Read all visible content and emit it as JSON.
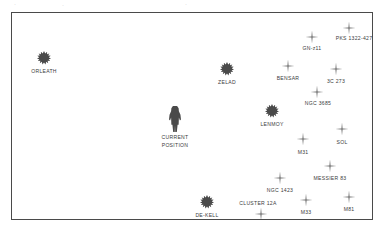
{
  "map": {
    "title": "star-chart",
    "frame_color": "#4a4a4a",
    "background_color": "#ffffff",
    "label_color": "#3c3c3c",
    "top_artifacts": [
      {
        "text": "·",
        "x": 14,
        "y": 1
      },
      {
        "text": "·",
        "x": 62,
        "y": 2
      },
      {
        "text": "·",
        "x": 185,
        "y": 1
      }
    ],
    "markers": [
      {
        "id": "orleath",
        "name": "ORLEATH",
        "type": "blob",
        "x": 43,
        "y": 57,
        "label_x": 43,
        "label_y": 67
      },
      {
        "id": "zelad",
        "name": "ZELAD",
        "type": "blob",
        "x": 226,
        "y": 68,
        "label_x": 226,
        "label_y": 78
      },
      {
        "id": "lenmoy",
        "name": "LENMOY",
        "type": "blob",
        "x": 271,
        "y": 110,
        "label_x": 271,
        "label_y": 120
      },
      {
        "id": "de-kell",
        "name": "DE-KELL",
        "type": "blob",
        "x": 206,
        "y": 201,
        "label_x": 206,
        "label_y": 211
      },
      {
        "id": "current-position",
        "name": "CURRENT POSITION",
        "name_line1": "CURRENT",
        "name_line2": "POSITION",
        "type": "figure",
        "x": 174,
        "y": 118,
        "label_x": 174,
        "label_y": 133
      },
      {
        "id": "gn-z11",
        "name": "GN-z11",
        "type": "cross",
        "x": 311,
        "y": 36,
        "label_x": 311,
        "label_y": 44
      },
      {
        "id": "pks-1322-427",
        "name": "PKS 1322-427",
        "type": "cross",
        "x": 348,
        "y": 27,
        "label_x": 353,
        "label_y": 34
      },
      {
        "id": "bensar",
        "name": "BENSAR",
        "type": "cross",
        "x": 287,
        "y": 65,
        "label_x": 287,
        "label_y": 74
      },
      {
        "id": "3c-273",
        "name": "3C 273",
        "type": "cross",
        "x": 335,
        "y": 68,
        "label_x": 335,
        "label_y": 77
      },
      {
        "id": "ngc-3685",
        "name": "NGC 3685",
        "type": "cross",
        "x": 316,
        "y": 91,
        "label_x": 317,
        "label_y": 99
      },
      {
        "id": "sol",
        "name": "SOL",
        "type": "cross",
        "x": 341,
        "y": 128,
        "label_x": 341,
        "label_y": 138
      },
      {
        "id": "m31",
        "name": "M31",
        "type": "cross",
        "x": 302,
        "y": 138,
        "label_x": 302,
        "label_y": 148
      },
      {
        "id": "messier-83",
        "name": "MESSIER 83",
        "type": "cross",
        "x": 329,
        "y": 165,
        "label_x": 329,
        "label_y": 174
      },
      {
        "id": "ngc-1423",
        "name": "NGC 1423",
        "type": "cross",
        "x": 279,
        "y": 177,
        "label_x": 279,
        "label_y": 186
      },
      {
        "id": "cluster-12a",
        "name": "CLUSTER 12A",
        "type": "cross",
        "x": 260,
        "y": 213,
        "label_x": 257,
        "label_y": 199
      },
      {
        "id": "m33",
        "name": "M33",
        "type": "cross",
        "x": 305,
        "y": 199,
        "label_x": 305,
        "label_y": 208
      },
      {
        "id": "m81",
        "name": "M81",
        "type": "cross",
        "x": 348,
        "y": 196,
        "label_x": 348,
        "label_y": 205
      }
    ]
  }
}
